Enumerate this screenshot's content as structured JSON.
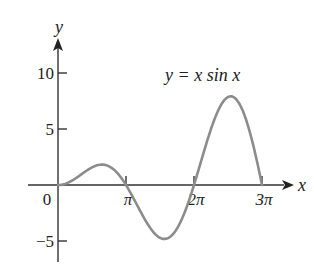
{
  "chart_data": {
    "type": "line",
    "title": "",
    "annotation": "y = x sin x",
    "xlabel": "x",
    "ylabel": "y",
    "function": "x*sin(x)",
    "xlim": [
      0,
      9.42477796
    ],
    "ylim": [
      -6.5,
      13
    ],
    "x_ticks": [
      {
        "value": 0,
        "label": "0"
      },
      {
        "value": 3.14159265,
        "label": "π"
      },
      {
        "value": 6.28318531,
        "label": "2π"
      },
      {
        "value": 9.42477796,
        "label": "3π"
      }
    ],
    "y_ticks": [
      {
        "value": 10,
        "label": "10"
      },
      {
        "value": 5,
        "label": "5"
      },
      {
        "value": -5,
        "label": "−5"
      }
    ],
    "grid": false,
    "legend": "none",
    "series": [
      {
        "name": "y = x sin x",
        "color": "#8c8c8c",
        "x": [
          0,
          0.785,
          1.571,
          2.029,
          2.356,
          3.142,
          3.927,
          4.913,
          5.498,
          6.283,
          7.069,
          7.979,
          8.639,
          9.425
        ],
        "values": [
          0,
          0.555,
          1.571,
          1.82,
          1.666,
          0,
          -2.777,
          -4.814,
          -3.888,
          0,
          4.998,
          7.917,
          6.109,
          0
        ]
      }
    ],
    "colors": {
      "axis": "#333333",
      "curve": "#8c8c8c",
      "text": "#222222"
    }
  }
}
